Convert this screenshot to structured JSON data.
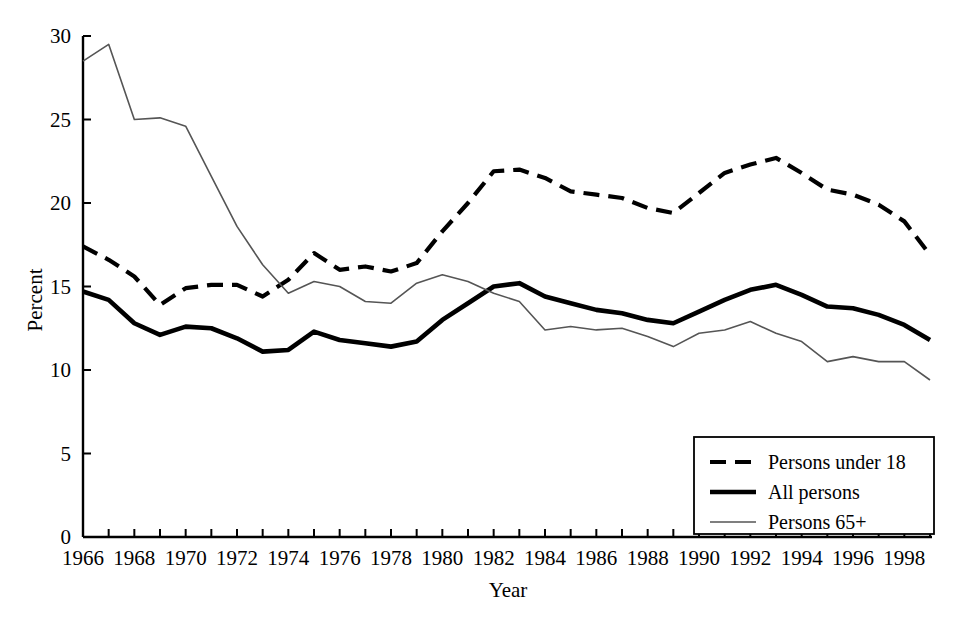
{
  "chart_data": {
    "type": "line",
    "title": "",
    "xlabel": "Year",
    "ylabel": "Percent",
    "xlim": [
      1966,
      1999
    ],
    "ylim": [
      0,
      30
    ],
    "yticks": [
      0,
      5,
      10,
      15,
      20,
      25,
      30
    ],
    "xticks": [
      1966,
      1967,
      1968,
      1969,
      1970,
      1971,
      1972,
      1973,
      1974,
      1975,
      1976,
      1977,
      1978,
      1979,
      1980,
      1981,
      1982,
      1983,
      1984,
      1985,
      1986,
      1987,
      1988,
      1989,
      1990,
      1991,
      1992,
      1993,
      1994,
      1995,
      1996,
      1997,
      1998,
      1999
    ],
    "xtick_labels": [
      "1966",
      "",
      "1968",
      "",
      "1970",
      "",
      "1972",
      "",
      "1974",
      "",
      "1976",
      "",
      "1978",
      "",
      "1980",
      "",
      "1982",
      "",
      "1984",
      "",
      "1986",
      "",
      "1988",
      "",
      "1990",
      "",
      "1992",
      "",
      "1994",
      "",
      "1996",
      "",
      "1998",
      ""
    ],
    "grid": false,
    "legend_position": "bottom-right",
    "x": [
      1966,
      1967,
      1968,
      1969,
      1970,
      1971,
      1972,
      1973,
      1974,
      1975,
      1976,
      1977,
      1978,
      1979,
      1980,
      1981,
      1982,
      1983,
      1984,
      1985,
      1986,
      1987,
      1988,
      1989,
      1990,
      1991,
      1992,
      1993,
      1994,
      1995,
      1996,
      1997,
      1998,
      1999
    ],
    "series": [
      {
        "name": "Persons under 18",
        "style": "dashed",
        "color": "#000000",
        "values": [
          17.4,
          16.6,
          15.6,
          13.9,
          14.9,
          15.1,
          15.1,
          14.4,
          15.4,
          17.0,
          16.0,
          16.2,
          15.9,
          16.4,
          18.3,
          20.0,
          21.9,
          22.0,
          21.5,
          20.7,
          20.5,
          20.3,
          19.7,
          19.4,
          20.6,
          21.8,
          22.3,
          22.7,
          21.8,
          20.8,
          20.5,
          19.9,
          18.9,
          16.9
        ]
      },
      {
        "name": "All persons",
        "style": "solid",
        "color": "#000000",
        "values": [
          14.7,
          14.2,
          12.8,
          12.1,
          12.6,
          12.5,
          11.9,
          11.1,
          11.2,
          12.3,
          11.8,
          11.6,
          11.4,
          11.7,
          13.0,
          14.0,
          15.0,
          15.2,
          14.4,
          14.0,
          13.6,
          13.4,
          13.0,
          12.8,
          13.5,
          14.2,
          14.8,
          15.1,
          14.5,
          13.8,
          13.7,
          13.3,
          12.7,
          11.8
        ]
      },
      {
        "name": "Persons 65+",
        "style": "thin",
        "color": "#555555",
        "values": [
          28.5,
          29.5,
          25.0,
          25.1,
          24.6,
          21.6,
          18.6,
          16.3,
          14.6,
          15.3,
          15.0,
          14.1,
          14.0,
          15.2,
          15.7,
          15.3,
          14.6,
          14.1,
          12.4,
          12.6,
          12.4,
          12.5,
          12.0,
          11.4,
          12.2,
          12.4,
          12.9,
          12.2,
          11.7,
          10.5,
          10.8,
          10.5,
          10.5,
          9.4
        ]
      }
    ]
  },
  "legend": {
    "entries": [
      {
        "label": "Persons under 18",
        "style": "dashed"
      },
      {
        "label": "All persons",
        "style": "solid"
      },
      {
        "label": "Persons 65+",
        "style": "thin"
      }
    ]
  }
}
